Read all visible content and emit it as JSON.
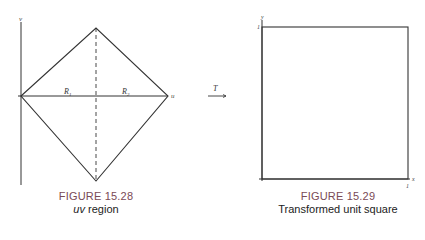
{
  "figure_left": {
    "caption_number": "FIGURE 15.28",
    "caption_title_italic": "uv",
    "caption_title_rest": " region",
    "axis_labels": {
      "vertical": "v",
      "horizontal": "u"
    },
    "region_labels": [
      "R1",
      "R2"
    ],
    "region_label_main": "R",
    "region_label_subs": [
      "1",
      "2"
    ]
  },
  "transform": {
    "label": "T"
  },
  "figure_right": {
    "caption_number": "FIGURE 15.29",
    "caption_title": "Transformed unit square",
    "axis_labels": {
      "vertical": "y",
      "horizontal": "x"
    },
    "tick_labels": {
      "y_top": "1",
      "x_right": "1"
    }
  }
}
